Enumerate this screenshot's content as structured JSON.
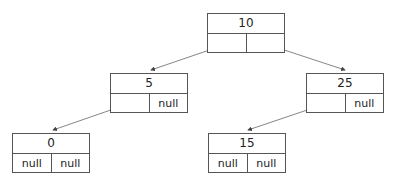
{
  "diagram": {
    "type": "binary-tree",
    "nodes": [
      {
        "id": "n10",
        "value": "10",
        "left": "",
        "right": "",
        "x": 207,
        "y": 13
      },
      {
        "id": "n5",
        "value": "5",
        "left": "",
        "right": "null",
        "x": 110,
        "y": 73
      },
      {
        "id": "n25",
        "value": "25",
        "left": "",
        "right": "null",
        "x": 306,
        "y": 73
      },
      {
        "id": "n0",
        "value": "0",
        "left": "null",
        "right": "null",
        "x": 12,
        "y": 133
      },
      {
        "id": "n15",
        "value": "15",
        "left": "null",
        "right": "null",
        "x": 208,
        "y": 133
      }
    ],
    "edges": [
      {
        "from": "n10",
        "to": "n5",
        "side": "left"
      },
      {
        "from": "n10",
        "to": "n25",
        "side": "right"
      },
      {
        "from": "n5",
        "to": "n0",
        "side": "left"
      },
      {
        "from": "n25",
        "to": "n15",
        "side": "left"
      }
    ]
  }
}
